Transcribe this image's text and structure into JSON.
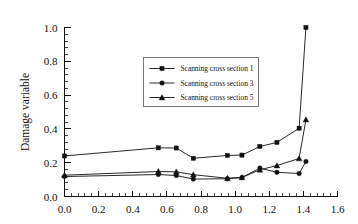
{
  "chart_data": {
    "type": "line",
    "title": "",
    "xlabel": "",
    "ylabel": "Damage variable",
    "xlim": [
      0.0,
      1.6
    ],
    "ylim": [
      0.0,
      1.0
    ],
    "xticks": [
      "0.0",
      "0.2",
      "0.4",
      "0.6",
      "0.8",
      "1.0",
      "1.2",
      "1.4",
      "1.6"
    ],
    "yticks": [
      "0.0",
      "0.2",
      "0.4",
      "0.6",
      "0.8",
      "1.0"
    ],
    "xtick_values": [
      0.0,
      0.2,
      0.4,
      0.6,
      0.8,
      1.0,
      1.2,
      1.4,
      1.6
    ],
    "ytick_values": [
      0.0,
      0.2,
      0.4,
      0.6,
      0.8,
      1.0
    ],
    "minor_ticks_per_interval": 4,
    "grid": false,
    "legend_position": "upper center",
    "series": [
      {
        "name": "Scanning cross section 1",
        "marker": "square",
        "x": [
          0.0,
          0.55,
          0.655,
          0.755,
          0.955,
          1.04,
          1.145,
          1.245,
          1.375,
          1.415
        ],
        "values": [
          0.24,
          0.288,
          0.287,
          0.226,
          0.243,
          0.245,
          0.296,
          0.32,
          0.404,
          1.0
        ]
      },
      {
        "name": "Scanning cross section 3",
        "marker": "circle",
        "x": [
          0.0,
          0.55,
          0.655,
          0.755,
          0.955,
          1.04,
          1.145,
          1.245,
          1.375,
          1.415
        ],
        "values": [
          0.118,
          0.13,
          0.124,
          0.103,
          0.105,
          0.112,
          0.168,
          0.143,
          0.136,
          0.207
        ]
      },
      {
        "name": "Scanning cross section 5",
        "marker": "triangle",
        "x": [
          0.0,
          0.55,
          0.655,
          0.755,
          0.955,
          1.04,
          1.145,
          1.245,
          1.375,
          1.415
        ],
        "values": [
          0.126,
          0.148,
          0.146,
          0.129,
          0.108,
          0.113,
          0.158,
          0.183,
          0.225,
          0.455
        ]
      }
    ],
    "colors": {
      "line": "#111111",
      "axis": "#111111",
      "legend_border": "#555555",
      "background": "#ffffff"
    }
  }
}
